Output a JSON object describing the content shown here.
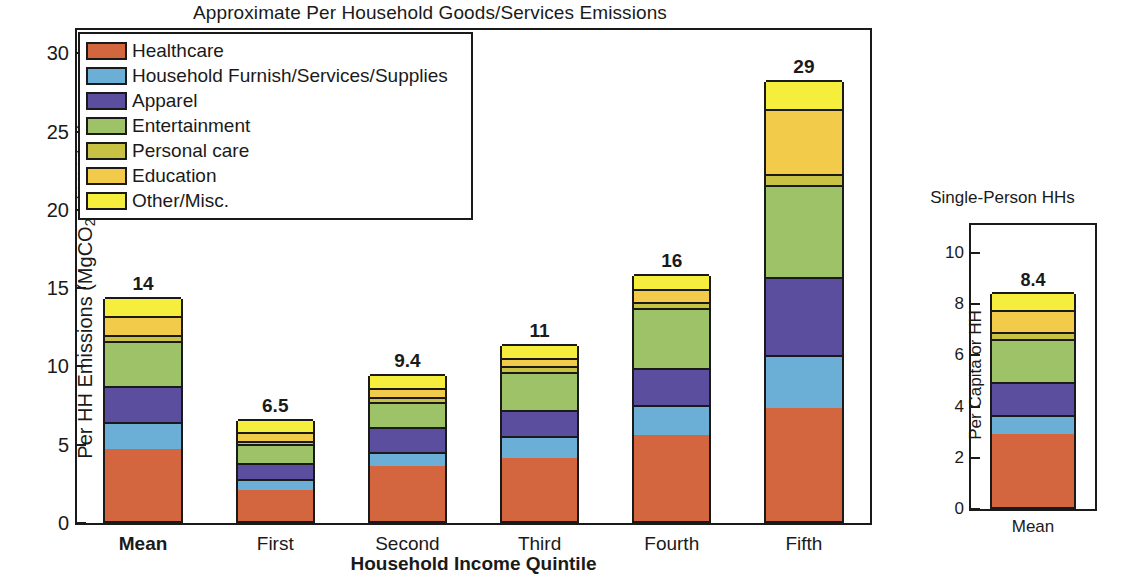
{
  "chart_data": {
    "type": "bar",
    "subtype": "stacked",
    "title": "Approximate Per Household Goods/Services Emissions",
    "xlabel": "Household Income Quintile",
    "ylabel": "Per HH Emissions (MgCO2e / HH / yr)",
    "ylabel_parts": {
      "pre": "Per HH Emissions (MgCO",
      "sub": "2",
      "post": "e / HH / yr)"
    },
    "grid": false,
    "legend_position": "upper-left-inside",
    "ylim": [
      0,
      31.5
    ],
    "yticks": [
      0,
      5,
      10,
      15,
      20,
      25,
      30
    ],
    "ytick_labels": [
      "0",
      "5",
      "10",
      "15",
      "20",
      "25",
      "30"
    ],
    "categories": [
      "Mean",
      "First",
      "Second",
      "Third",
      "Fourth",
      "Fifth"
    ],
    "category_bold": [
      true,
      false,
      false,
      false,
      false,
      false
    ],
    "bar_totals": [
      "14",
      "6.5",
      "9.4",
      "11",
      "16",
      "29"
    ],
    "series": [
      {
        "name": "Healthcare",
        "color": "#D4663F",
        "values": [
          4.6,
          2.0,
          3.5,
          4.0,
          5.5,
          7.2
        ]
      },
      {
        "name": "Household Furnish/Services/Supplies",
        "color": "#6BAED6",
        "values": [
          1.7,
          0.7,
          0.9,
          1.4,
          1.9,
          3.4
        ]
      },
      {
        "name": "Apparel",
        "color": "#5B4E9E",
        "values": [
          2.3,
          1.0,
          1.6,
          1.7,
          2.4,
          5.0
        ]
      },
      {
        "name": "Entertainment",
        "color": "#9DC268",
        "values": [
          2.9,
          1.2,
          1.6,
          2.4,
          3.8,
          5.9
        ]
      },
      {
        "name": "Personal care",
        "color": "#C8C244",
        "values": [
          0.4,
          0.2,
          0.3,
          0.4,
          0.4,
          0.7
        ]
      },
      {
        "name": "Education",
        "color": "#F2CB4B",
        "values": [
          1.2,
          0.6,
          0.6,
          0.5,
          0.8,
          4.1
        ]
      },
      {
        "name": "Other/Misc.",
        "color": "#F5EE3C",
        "values": [
          1.2,
          0.8,
          0.9,
          0.9,
          1.0,
          1.9
        ]
      }
    ],
    "inset": {
      "title": "Single-Person HHs",
      "ylabel": "Per Capita or HH",
      "ylim": [
        0,
        11.1
      ],
      "yticks": [
        0,
        2,
        4,
        6,
        8,
        10
      ],
      "ytick_labels": [
        "0",
        "2",
        "4",
        "6",
        "8",
        "10"
      ],
      "categories": [
        "Mean"
      ],
      "bar_totals": [
        "8.4"
      ],
      "series": [
        {
          "name": "Healthcare",
          "color": "#D4663F",
          "values": [
            2.85
          ]
        },
        {
          "name": "Household Furnish/Services/Supplies",
          "color": "#6BAED6",
          "values": [
            0.75
          ]
        },
        {
          "name": "Apparel",
          "color": "#5B4E9E",
          "values": [
            1.3
          ]
        },
        {
          "name": "Entertainment",
          "color": "#9DC268",
          "values": [
            1.65
          ]
        },
        {
          "name": "Personal care",
          "color": "#C8C244",
          "values": [
            0.3
          ]
        },
        {
          "name": "Education",
          "color": "#F2CB4B",
          "values": [
            0.85
          ]
        },
        {
          "name": "Other/Misc.",
          "color": "#F5EE3C",
          "values": [
            0.7
          ]
        }
      ]
    }
  }
}
